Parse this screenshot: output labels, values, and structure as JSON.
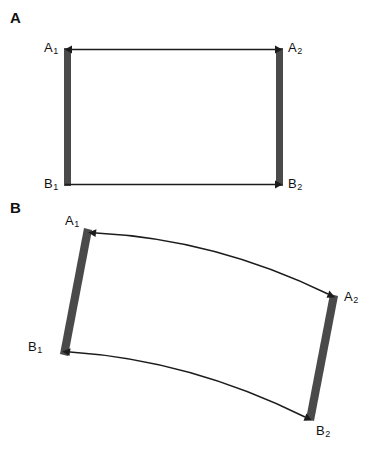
{
  "figure": {
    "type": "scientific-diagram",
    "caption_letters": [
      "A",
      "B"
    ],
    "background_color": "#ffffff",
    "bar_color": "#4a4a4a",
    "arrow_color": "#1c1c1c"
  },
  "panel_a": {
    "letter": "A",
    "description": "Two parallel vertical bars joined by straight horizontal arrows",
    "labels": {
      "top_left": {
        "base": "A",
        "sub": "1"
      },
      "top_right": {
        "base": "A",
        "sub": "2"
      },
      "bottom_left": {
        "base": "B",
        "sub": "1"
      },
      "bottom_right": {
        "base": "B",
        "sub": "2"
      }
    },
    "bars": [
      {
        "name": "left-bar",
        "orientation": "vertical",
        "x": 64,
        "y_top": 48,
        "y_bottom": 186,
        "width": 7
      },
      {
        "name": "right-bar",
        "orientation": "vertical",
        "x": 276,
        "y_top": 48,
        "y_bottom": 186,
        "width": 7
      }
    ],
    "arrows": [
      {
        "name": "top-arrow",
        "style": "straight",
        "heads": "double",
        "from": "A1",
        "to": "A2"
      },
      {
        "name": "bottom-arrow",
        "style": "straight",
        "heads": "single-right",
        "from": "B1",
        "to": "B2"
      }
    ]
  },
  "panel_b": {
    "letter": "B",
    "description": "Two tilted bars joined by curved double-headed arrows",
    "labels": {
      "top_left": {
        "base": "A",
        "sub": "1"
      },
      "top_right": {
        "base": "A",
        "sub": "2"
      },
      "bottom_left": {
        "base": "B",
        "sub": "1"
      },
      "bottom_right": {
        "base": "B",
        "sub": "2"
      }
    },
    "bars": [
      {
        "name": "left-bar",
        "orientation": "tilted",
        "top_x": 88,
        "top_y": 229,
        "bottom_x": 62,
        "bottom_y": 355,
        "width": 8
      },
      {
        "name": "right-bar",
        "orientation": "tilted",
        "top_x": 334,
        "top_y": 295,
        "bottom_x": 308,
        "bottom_y": 420,
        "width": 8
      }
    ],
    "arrows": [
      {
        "name": "top-curved-arrow",
        "style": "curved",
        "heads": "double",
        "from": "A1",
        "to": "A2",
        "bow": "up"
      },
      {
        "name": "bottom-curved-arrow",
        "style": "curved",
        "heads": "double",
        "from": "B1",
        "to": "B2",
        "bow": "up"
      }
    ]
  }
}
